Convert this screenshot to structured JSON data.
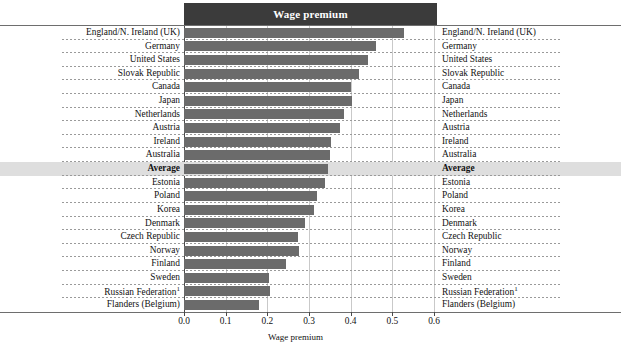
{
  "header": {
    "title": "Wage premium"
  },
  "axis": {
    "xlabel": "Wage premium",
    "ticks": [
      "0.0",
      "0.1",
      "0.2",
      "0.3",
      "0.4",
      "0.5",
      "0.6"
    ]
  },
  "chart_data": {
    "type": "bar",
    "orientation": "horizontal",
    "title": "Wage premium",
    "xlabel": "Wage premium",
    "ylabel": "",
    "xlim": [
      0.0,
      0.6
    ],
    "grid": true,
    "legend": null,
    "highlight_category": "Average",
    "footnote_marker": "1",
    "categories": [
      "England/N. Ireland (UK)",
      "Germany",
      "United States",
      "Slovak Republic",
      "Canada",
      "Japan",
      "Netherlands",
      "Austria",
      "Ireland",
      "Australia",
      "Average",
      "Estonia",
      "Poland",
      "Korea",
      "Denmark",
      "Czech Republic",
      "Norway",
      "Finland",
      "Sweden",
      "Russian Federation",
      "Flanders (Belgium)"
    ],
    "values": [
      0.527,
      0.46,
      0.441,
      0.42,
      0.4,
      0.403,
      0.383,
      0.374,
      0.353,
      0.35,
      0.345,
      0.338,
      0.32,
      0.312,
      0.29,
      0.273,
      0.276,
      0.245,
      0.204,
      0.206,
      0.18
    ]
  },
  "rows": [
    {
      "label": "England/N. Ireland (UK)",
      "value": 0.527,
      "highlight": false,
      "footnote": ""
    },
    {
      "label": "Germany",
      "value": 0.46,
      "highlight": false,
      "footnote": ""
    },
    {
      "label": "United States",
      "value": 0.441,
      "highlight": false,
      "footnote": ""
    },
    {
      "label": "Slovak Republic",
      "value": 0.42,
      "highlight": false,
      "footnote": ""
    },
    {
      "label": "Canada",
      "value": 0.4,
      "highlight": false,
      "footnote": ""
    },
    {
      "label": "Japan",
      "value": 0.403,
      "highlight": false,
      "footnote": ""
    },
    {
      "label": "Netherlands",
      "value": 0.383,
      "highlight": false,
      "footnote": ""
    },
    {
      "label": "Austria",
      "value": 0.374,
      "highlight": false,
      "footnote": ""
    },
    {
      "label": "Ireland",
      "value": 0.353,
      "highlight": false,
      "footnote": ""
    },
    {
      "label": "Australia",
      "value": 0.35,
      "highlight": false,
      "footnote": ""
    },
    {
      "label": "Average",
      "value": 0.345,
      "highlight": true,
      "footnote": ""
    },
    {
      "label": "Estonia",
      "value": 0.338,
      "highlight": false,
      "footnote": ""
    },
    {
      "label": "Poland",
      "value": 0.32,
      "highlight": false,
      "footnote": ""
    },
    {
      "label": "Korea",
      "value": 0.312,
      "highlight": false,
      "footnote": ""
    },
    {
      "label": "Denmark",
      "value": 0.29,
      "highlight": false,
      "footnote": ""
    },
    {
      "label": "Czech Republic",
      "value": 0.273,
      "highlight": false,
      "footnote": ""
    },
    {
      "label": "Norway",
      "value": 0.276,
      "highlight": false,
      "footnote": ""
    },
    {
      "label": "Finland",
      "value": 0.245,
      "highlight": false,
      "footnote": ""
    },
    {
      "label": "Sweden",
      "value": 0.204,
      "highlight": false,
      "footnote": ""
    },
    {
      "label": "Russian Federation",
      "value": 0.206,
      "highlight": false,
      "footnote": "1"
    },
    {
      "label": "Flanders (Belgium)",
      "value": 0.18,
      "highlight": false,
      "footnote": ""
    }
  ],
  "colors": {
    "bar": "#6b6b6b",
    "title_bar": "#3b3b3b",
    "highlight_band": "#dedede",
    "grid": "#c9c9c9",
    "axis": "#4a4a4a"
  }
}
